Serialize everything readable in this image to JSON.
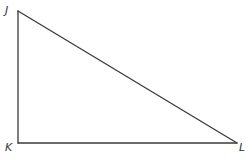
{
  "diagram": {
    "type": "right-triangle",
    "background": "#ffffff",
    "line_color": "#3a3a3a",
    "label_color": "#333333",
    "vertices": [
      {
        "name": "J",
        "label": "J",
        "x": 18,
        "y": 11,
        "label_x": 5,
        "label_y": 14
      },
      {
        "name": "K",
        "label": "K",
        "x": 18,
        "y": 143,
        "label_x": 5,
        "label_y": 151
      },
      {
        "name": "L",
        "label": "L",
        "x": 237,
        "y": 143,
        "label_x": 239,
        "label_y": 151
      }
    ],
    "sides": [
      {
        "name": "JK",
        "from": "J",
        "to": "K"
      },
      {
        "name": "KL",
        "from": "K",
        "to": "L"
      },
      {
        "name": "JL",
        "from": "J",
        "to": "L"
      }
    ],
    "right_angle_at": "K"
  }
}
